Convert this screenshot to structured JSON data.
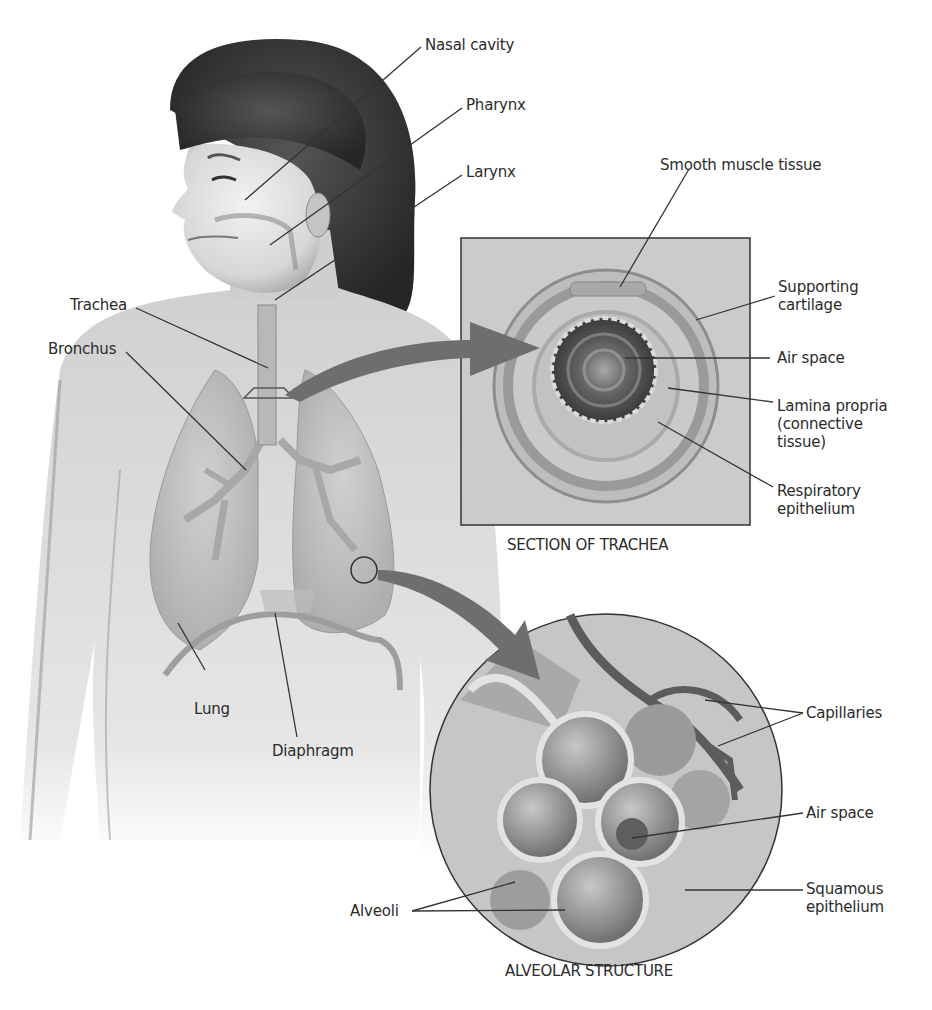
{
  "figure": {
    "body_labels": {
      "nasal_cavity": "Nasal cavity",
      "pharynx": "Pharynx",
      "larynx": "Larynx",
      "trachea": "Trachea",
      "bronchus": "Bronchus",
      "lung": "Lung",
      "diaphragm": "Diaphragm"
    },
    "trachea_section": {
      "caption": "SECTION OF TRACHEA",
      "labels": {
        "smooth_muscle": "Smooth muscle tissue",
        "supporting_cartilage": "Supporting\ncartilage",
        "air_space": "Air space",
        "lamina_propria": "Lamina propria\n(connective\ntissue)",
        "respiratory_epithelium": "Respiratory\nepithelium"
      }
    },
    "alveolar_structure": {
      "caption": "ALVEOLAR STRUCTURE",
      "labels": {
        "capillaries": "Capillaries",
        "air_space": "Air space",
        "squamous_epithelium": "Squamous\nepithelium",
        "alveoli": "Alveoli"
      }
    },
    "colors": {
      "background": "#ffffff",
      "skin": "#d8d8d8",
      "hair": "#3a3a3a",
      "panel": "#c9c9c9",
      "arrow": "#6e6e6e",
      "leader_line": "#333333"
    }
  }
}
